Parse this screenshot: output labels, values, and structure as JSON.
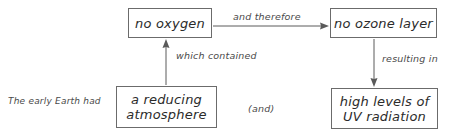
{
  "diagram": {
    "stroke_color": "#5a5a5a",
    "text_color": "#2b2b2b",
    "label_color": "#4a4a4a",
    "background_color": "#ffffff",
    "nodes": [
      {
        "id": "no-oxygen",
        "text": "no oxygen"
      },
      {
        "id": "no-ozone-layer",
        "text": "no ozone layer"
      },
      {
        "id": "reducing-atmosphere",
        "text": "a reducing\natmosphere"
      },
      {
        "id": "uv-radiation",
        "text": "high levels of\nUV radiation"
      }
    ],
    "labels": [
      {
        "id": "early-earth",
        "text": "The early Earth had"
      },
      {
        "id": "and-therefore",
        "text": "and therefore"
      },
      {
        "id": "which-contained",
        "text": "which contained"
      },
      {
        "id": "resulting-in",
        "text": "resulting in"
      },
      {
        "id": "and",
        "text": "(and)"
      }
    ],
    "edges": [
      {
        "id": "no-oxygen-to-no-ozone-layer",
        "from": "no-oxygen",
        "to": "no-ozone-layer",
        "label": "and therefore",
        "direction": "right"
      },
      {
        "id": "reducing-atmosphere-to-no-oxygen",
        "from": "reducing-atmosphere",
        "to": "no-oxygen",
        "label": "which contained",
        "direction": "up"
      },
      {
        "id": "no-ozone-layer-to-uv-radiation",
        "from": "no-ozone-layer",
        "to": "uv-radiation",
        "label": "resulting in",
        "direction": "down"
      }
    ]
  }
}
